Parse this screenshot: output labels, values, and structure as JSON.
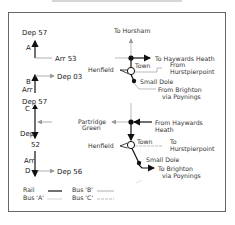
{
  "diagram": {
    "panel1": {
      "labels": {
        "dep_top": "Dep 57",
        "letter_a": "A",
        "arr": "Arr 53",
        "letter_b": "B",
        "arr_b": "Arr",
        "dep_b": "Dep 03"
      },
      "places": {
        "horsham": "To Horsham",
        "haywards": "To Haywards Heath",
        "henfield": "Henfield",
        "town": "Town",
        "from_hurst_1": "From",
        "from_hurst_2": "Hurstpierpoint",
        "small_dole": "Small Dole",
        "from_brighton_1": "From Brighton",
        "from_brighton_2": "via Poynings"
      }
    },
    "panel2": {
      "labels": {
        "dep_top": "Dep 57",
        "letter_c": "C",
        "dep_mid": "Dep",
        "num_52": "52",
        "arr_d": "Arr",
        "letter_d": "D",
        "dep_56": "Dep 56"
      },
      "places": {
        "partridge_1": "Partridge",
        "partridge_2": "Green",
        "from_haywards_1": "From Haywards",
        "from_haywards_2": "Heath",
        "henfield": "Henfield",
        "town": "Town",
        "to_hurst_1": "To",
        "to_hurst_2": "Hurstpierpoint",
        "small_dole": "Small Dole",
        "to_brighton_1": "To Brighton",
        "to_brighton_2": "via Poynings"
      }
    },
    "legend": {
      "rail": "Rail",
      "bus_a": "Bus 'A'",
      "bus_b": "Bus 'B'",
      "bus_c": "Bus 'C'"
    },
    "colors": {
      "rail": "#111111",
      "bus": "#aaaaaa",
      "frame": "#666666"
    }
  }
}
